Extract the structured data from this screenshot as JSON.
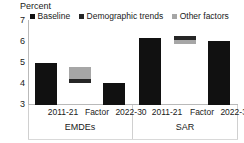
{
  "chart_data": {
    "type": "bar",
    "title": "",
    "subtitle": "",
    "unit_label": "Percent",
    "xlabel": "",
    "ylabel": "",
    "ylim": [
      3,
      7
    ],
    "yticks": [
      "7",
      "6",
      "5",
      "4",
      "3"
    ],
    "grid": false,
    "legend_position": "top",
    "legend": [
      {
        "label": "Baseline",
        "color": "#111111"
      },
      {
        "label": "Demographic trends",
        "color": "#262626"
      },
      {
        "label": "Other factors",
        "color": "#a6a6a6"
      }
    ],
    "groups": [
      {
        "name": "EMDEs",
        "categories": [
          "2011-21",
          "Factor",
          "2022-30"
        ]
      },
      {
        "name": "SAR",
        "categories": [
          "2011-21",
          "Factor",
          "2022-30"
        ]
      }
    ],
    "bars": [
      {
        "group": "EMDEs",
        "category": "2011-21",
        "series": "Baseline",
        "base": 3.0,
        "top": 4.97,
        "value": 4.97,
        "color": "#111111"
      },
      {
        "group": "EMDEs",
        "category": "Factor",
        "series": "Demographic trends",
        "base": 4.05,
        "top": 4.22,
        "value": 0.17,
        "color": "#262626"
      },
      {
        "group": "EMDEs",
        "category": "Factor",
        "series": "Other factors",
        "base": 4.22,
        "top": 4.78,
        "value": 0.56,
        "color": "#a6a6a6"
      },
      {
        "group": "EMDEs",
        "category": "2022-30",
        "series": "Baseline",
        "base": 3.0,
        "top": 4.03,
        "value": 4.03,
        "color": "#111111"
      },
      {
        "group": "SAR",
        "category": "2011-21",
        "series": "Baseline",
        "base": 3.0,
        "top": 6.13,
        "value": 6.13,
        "color": "#111111"
      },
      {
        "group": "SAR",
        "category": "Factor",
        "series": "Demographic trends",
        "base": 6.08,
        "top": 6.25,
        "value": 0.17,
        "color": "#262626"
      },
      {
        "group": "SAR",
        "category": "Factor",
        "series": "Other factors",
        "base": 5.85,
        "top": 6.08,
        "value": 0.23,
        "color": "#a6a6a6"
      },
      {
        "group": "SAR",
        "category": "2022-30",
        "series": "Baseline",
        "base": 3.0,
        "top": 6.03,
        "value": 6.03,
        "color": "#111111"
      }
    ]
  },
  "yticks": {
    "t7": "7",
    "t6": "6",
    "t5": "5",
    "t4": "4",
    "t3": "3"
  },
  "legend": {
    "baseline": "Baseline",
    "demographic": "Demographic trends",
    "other": "Other factors"
  },
  "axis": {
    "unit": "Percent"
  },
  "categories": {
    "emdes_c1": "2011-21",
    "emdes_c2": "Factor",
    "emdes_c3": "2022-30",
    "sar_c1": "2011-21",
    "sar_c2": "Factor",
    "sar_c3": "2022-30"
  },
  "groups": {
    "emdes": "EMDEs",
    "sar": "SAR"
  }
}
